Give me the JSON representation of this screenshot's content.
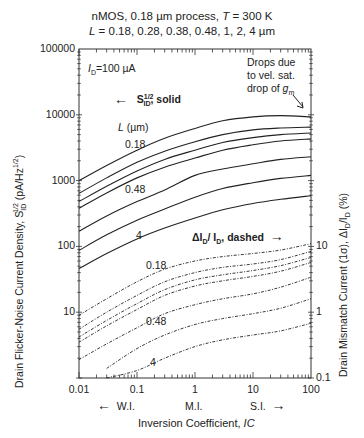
{
  "chart_data": {
    "type": "line",
    "title": "nMOS, 0.18 µm process, T = 300 K",
    "subtitle": "L = 0.18, 0.28, 0.38, 0.48, 1, 2, 4 µm",
    "xlabel": "Inversion Coefficient, IC",
    "ylabel_left": "Drain Flicker-Noise Current Density, S_ID^1/2 (pA/Hz^1/2)",
    "ylabel_right": "Drain Mismatch Current (1σ), ΔI_D/I_D (%)",
    "xscale": "log",
    "yscale": "log",
    "xlim": [
      0.01,
      100
    ],
    "ylim_left": [
      1,
      100000
    ],
    "ylim_right": [
      0.1,
      10000
    ],
    "x_ticks": [
      "0.01",
      "0.1",
      "1",
      "10",
      "100"
    ],
    "y_ticks_left": [
      "10",
      "100",
      "1000",
      "10000",
      "100000"
    ],
    "y_ticks_right": [
      "0.1",
      "1",
      "10"
    ],
    "x": [
      0.01,
      0.03,
      0.1,
      0.3,
      1,
      3,
      10,
      30,
      100
    ],
    "series_solid_noise": [
      {
        "name": "L=0.18 µm",
        "values": [
          1000,
          1700,
          2900,
          4400,
          6200,
          8100,
          9300,
          9700,
          9300
        ]
      },
      {
        "name": "L=0.28 µm",
        "values": [
          640,
          1100,
          1900,
          2800,
          3900,
          5000,
          5900,
          6300,
          6500
        ]
      },
      {
        "name": "L=0.38 µm",
        "values": [
          480,
          820,
          1400,
          2100,
          2900,
          3800,
          4500,
          5000,
          5300
        ]
      },
      {
        "name": "L=0.48 µm",
        "values": [
          380,
          650,
          1100,
          1600,
          2200,
          2900,
          3500,
          4000,
          4300
        ]
      },
      {
        "name": "L=1 µm",
        "values": [
          170,
          290,
          480,
          720,
          1200,
          1500,
          1800,
          2100,
          2300
        ]
      },
      {
        "name": "L=2 µm",
        "values": [
          87,
          150,
          250,
          370,
          560,
          760,
          930,
          1080,
          1200
        ]
      },
      {
        "name": "L=4 µm",
        "values": [
          46,
          78,
          130,
          190,
          270,
          360,
          450,
          520,
          590
        ]
      }
    ],
    "series_dashed_mismatch_pct": [
      {
        "name": "L=0.18 µm",
        "values": [
          0.9,
          1.6,
          2.9,
          4.5,
          6.0,
          7.0,
          7.8,
          8.8,
          11
        ]
      },
      {
        "name": "L=0.28 µm",
        "values": [
          0.55,
          1.0,
          1.8,
          2.9,
          4.0,
          4.8,
          5.4,
          6.3,
          8.4
        ]
      },
      {
        "name": "L=0.38 µm",
        "values": [
          0.42,
          0.75,
          1.35,
          2.2,
          3.1,
          3.7,
          4.3,
          5.1,
          6.8
        ]
      },
      {
        "name": "L=0.48 µm",
        "values": [
          0.35,
          0.62,
          1.1,
          1.8,
          2.5,
          3.0,
          3.5,
          4.2,
          5.7
        ]
      },
      {
        "name": "L=1 µm",
        "values": [
          0.19,
          0.33,
          0.58,
          0.95,
          1.3,
          1.6,
          1.9,
          2.4,
          3.4
        ]
      },
      {
        "name": "L=2 µm",
        "values": [
          null,
          0.14,
          0.28,
          0.45,
          0.65,
          0.8,
          0.95,
          1.15,
          1.6
        ]
      },
      {
        "name": "L=4 µm",
        "values": [
          null,
          0.1,
          0.13,
          0.2,
          0.3,
          0.38,
          0.45,
          0.52,
          0.68
        ]
      }
    ],
    "annotations": [
      "I_D = 100 µA",
      "S_ID^1/2, solid (left axis)",
      "ΔI_D/I_D, dashed (right axis)",
      "L (µm)",
      "Drops due to vel. sat. drop of g_m",
      "W.I.",
      "M.I.",
      "S.I."
    ],
    "grid": false,
    "legend_position": "inline labels"
  },
  "text": {
    "title1": "nMOS, 0.18 µm process, ",
    "title1_T": "T",
    "title1_end": " = 300 K",
    "title2_L": "L",
    "title2_rest": " = 0.18, 0.28, 0.38, 0.48, 1, 2, 4 µm",
    "ylabel_left": "Drain Flicker-Noise Current Density, S",
    "ylabel_left_sub": "ID",
    "ylabel_left_sup": "1/2",
    "ylabel_left_unit": " (pA/Hz",
    "ylabel_left_unit_sup": "1/2",
    "ylabel_left_close": ")",
    "ylabel_right": "Drain Mismatch Current (1σ), ΔI",
    "ylabel_right_sub": "D",
    "ylabel_right_mid": "/I",
    "ylabel_right_sub2": "D",
    "ylabel_right_end": " (%)",
    "xlabel": "Inversion Coefficient, ",
    "xlabel_italic": "IC",
    "xticks": [
      "0.01",
      "0.1",
      "1",
      "10",
      "100"
    ],
    "yticks_left": [
      "100000",
      "10000",
      "1000",
      "100",
      "10"
    ],
    "yticks_right": [
      "10",
      "1",
      "0.1"
    ],
    "region_wi": "W.I.",
    "region_mi": "M.I.",
    "region_si": "S.I.",
    "arrow_left": "←",
    "arrow_right": "→",
    "id_label": "I",
    "id_sub": "D",
    "id_value": "=100 µA",
    "solid_S": "S",
    "solid_sup": "1/2",
    "solid_sub": "ID",
    "solid_text": ", solid",
    "dashed_text1": "ΔI",
    "dashed_sub": "D",
    "dashed_text2": "/ I",
    "dashed_sub2": "D",
    "dashed_text3": ", dashed",
    "lum_label": "L",
    "lum_unit": " (µm)",
    "drops1": "Drops due",
    "drops2": "to vel. sat.",
    "drops3": "drop of ",
    "drops_gm": "g",
    "drops_gm_sub": "m",
    "curve_labels": {
      "s018": "0.18",
      "s048": "0.48",
      "s4": "4",
      "d018": "0.18",
      "d048": "0.48",
      "d4": "4"
    }
  }
}
